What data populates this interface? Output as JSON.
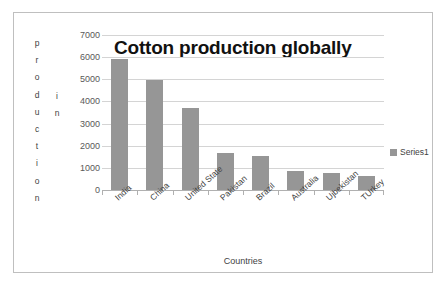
{
  "chart_data": {
    "type": "bar",
    "title": "Cotton production globally",
    "xlabel": "Countries",
    "ylabel": "production in",
    "ylabel_letters_column1": [
      "p",
      "r",
      "o",
      "d",
      "u",
      "c",
      "t",
      "i",
      "o",
      "n"
    ],
    "ylabel_letters_column2": [
      "i",
      "n"
    ],
    "categories": [
      "India",
      "China",
      "United State",
      "Pakistan",
      "Brazil",
      "Australia",
      "Ujbekistan",
      "TUrkey"
    ],
    "values": [
      5930,
      4960,
      3710,
      1670,
      1550,
      880,
      760,
      630
    ],
    "series": [
      {
        "name": "Series1",
        "values": [
          5930,
          4960,
          3710,
          1670,
          1550,
          880,
          760,
          630
        ]
      }
    ],
    "ylim": [
      0,
      7000
    ],
    "ytick_labels": [
      "7000",
      "6000",
      "5000",
      "4000",
      "3000",
      "2000",
      "1000",
      "0"
    ],
    "ytick_values": [
      7000,
      6000,
      5000,
      4000,
      3000,
      2000,
      1000,
      0
    ],
    "grid": true,
    "legend_position": "right",
    "legend_entries": [
      "Series1"
    ],
    "colors": {
      "bar": "#969696",
      "gridline": "#d4d4d4",
      "axis": "#b0b0b0",
      "border": "#bfbfbf",
      "title_text": "#111111",
      "label_text": "#3f3f3f",
      "tick_text": "#595959",
      "background": "#ffffff"
    }
  }
}
